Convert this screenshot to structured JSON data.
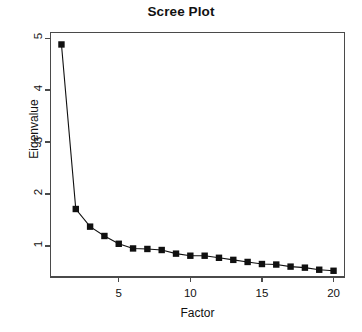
{
  "chart_data": {
    "type": "line",
    "title": "Scree Plot",
    "xlabel": "Factor",
    "ylabel": "Eigenvalue",
    "marker": "filled-square",
    "grid": false,
    "legend": null,
    "x": [
      1,
      2,
      3,
      4,
      5,
      6,
      7,
      8,
      9,
      10,
      11,
      12,
      13,
      14,
      15,
      16,
      17,
      18,
      19,
      20
    ],
    "values": [
      4.88,
      1.71,
      1.37,
      1.19,
      1.04,
      0.95,
      0.94,
      0.92,
      0.85,
      0.81,
      0.81,
      0.77,
      0.73,
      0.69,
      0.65,
      0.64,
      0.6,
      0.58,
      0.54,
      0.52
    ],
    "categories": [
      "1",
      "2",
      "3",
      "4",
      "5",
      "6",
      "7",
      "8",
      "9",
      "10",
      "11",
      "12",
      "13",
      "14",
      "15",
      "16",
      "17",
      "18",
      "19",
      "20"
    ],
    "xlim": [
      0.2,
      20.8
    ],
    "ylim": [
      0.4,
      5.12
    ],
    "xticks": [
      5,
      10,
      15,
      20
    ],
    "xtick_labels": [
      "5",
      "10",
      "15",
      "20"
    ],
    "yticks": [
      1,
      2,
      3,
      4,
      5
    ],
    "ytick_labels": [
      "1",
      "2",
      "3",
      "4",
      "5"
    ],
    "series_color": "#101010",
    "line_width": 1.1
  }
}
